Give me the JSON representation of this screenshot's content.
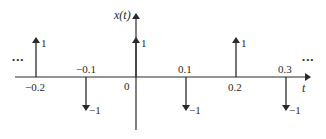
{
  "diagram": {
    "title_axis_y": "x(t)",
    "title_axis_x": "t",
    "origin_label": "0",
    "ellipsis_left": "•••",
    "ellipsis_right": "•••",
    "impulses": [
      {
        "t": "−0.2",
        "value": 1,
        "amp_label": "1"
      },
      {
        "t": "−0.1",
        "value": -1,
        "amp_label": "−1"
      },
      {
        "t": "0",
        "value": 1,
        "amp_label": "1"
      },
      {
        "t": "0.1",
        "value": -1,
        "amp_label": "−1"
      },
      {
        "t": "0.2",
        "value": 1,
        "amp_label": "1"
      },
      {
        "t": "0.3",
        "value": -1,
        "amp_label": "−1"
      }
    ],
    "colors": {
      "stroke": "#2a2a2a",
      "background": "#ffffff"
    }
  }
}
